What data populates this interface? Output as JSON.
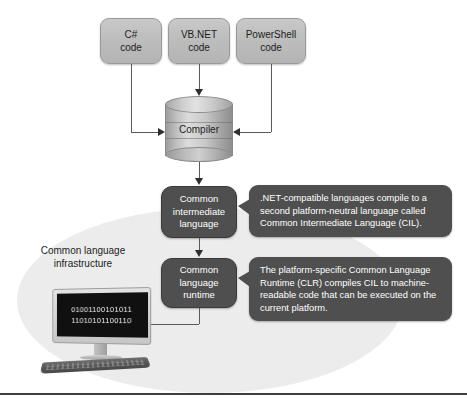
{
  "diagram": {
    "colors": {
      "source_box_fill": "#bdbdbd",
      "dark_box_fill": "#4f4f4f",
      "callout_fill": "#4f4f4f",
      "ellipse_fill": "#ececed",
      "connector": "#5a5a5a",
      "screen_background": "#101010",
      "screen_text": "#f2f2f2",
      "bottom_rule": "#3d3d3d"
    },
    "source_boxes": [
      {
        "line1": "C#",
        "line2": "code"
      },
      {
        "line1": "VB.NET",
        "line2": "code"
      },
      {
        "line1": "PowerShell",
        "line2": "code"
      }
    ],
    "compiler": {
      "label": "Compiler",
      "shape": "cylinder-icon"
    },
    "process_boxes": [
      {
        "line1": "Common",
        "line2": "intermediate",
        "line3": "language"
      },
      {
        "line1": "Common",
        "line2": "language",
        "line3": "runtime"
      }
    ],
    "callouts": [
      {
        "text": ".NET-compatible languages compile to a second platform-neutral language called Common Intermediate Language (CIL)."
      },
      {
        "text": "The platform-specific Common Language Runtime (CLR) compiles CIL to machine-readable code that can be executed on the current platform."
      }
    ],
    "region_label": {
      "line1": "Common language",
      "line2": "infrastructure"
    },
    "computer": {
      "screen_lines": [
        "01001100101011",
        "11010101100110"
      ]
    }
  }
}
